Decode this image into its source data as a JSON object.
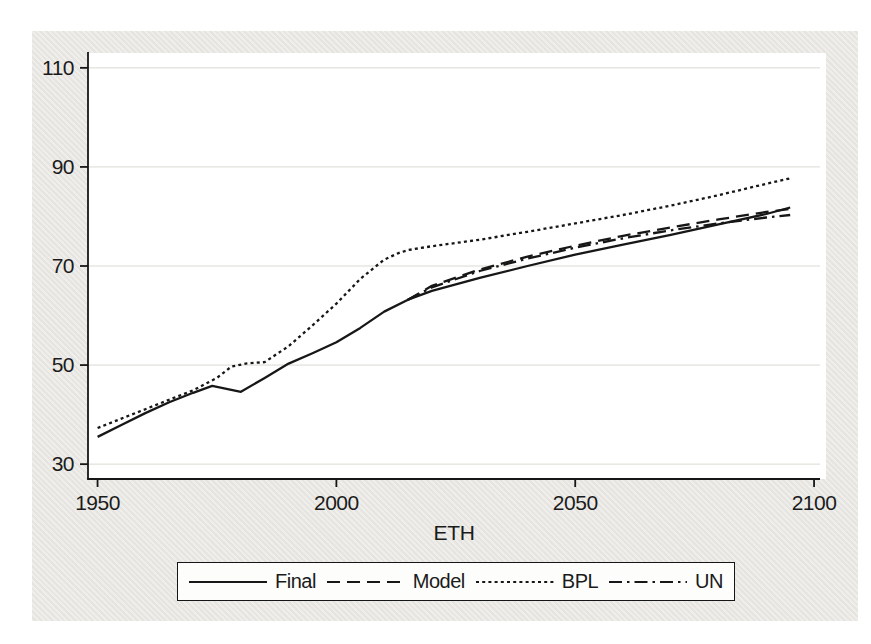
{
  "figure": {
    "xlabel": "ETH",
    "background_color": "#e9e8e4",
    "plot_background": "#ffffff",
    "line_color": "#171717",
    "grid_color": "#d9d9d2",
    "text_color": "#1b1b1b"
  },
  "chart_data": {
    "type": "line",
    "title": "",
    "xlabel": "ETH",
    "ylabel": "",
    "xlim": [
      1948,
      2102.5
    ],
    "ylim": [
      27,
      113
    ],
    "xticks": [
      1950,
      2000,
      2050,
      2100
    ],
    "yticks": [
      30,
      50,
      70,
      90,
      110
    ],
    "grid": "horizontal",
    "legend_position": "bottom",
    "series": [
      {
        "name": "Final",
        "dash": "solid",
        "points": [
          [
            1950,
            35.5
          ],
          [
            1955,
            37.9
          ],
          [
            1960,
            40.3
          ],
          [
            1965,
            42.5
          ],
          [
            1970,
            44.4
          ],
          [
            1974,
            45.8
          ],
          [
            1980,
            44.6
          ],
          [
            1985,
            47.4
          ],
          [
            1990,
            50.3
          ],
          [
            1995,
            52.4
          ],
          [
            2000,
            54.6
          ],
          [
            2005,
            57.5
          ],
          [
            2010,
            60.8
          ],
          [
            2015,
            63.2
          ],
          [
            2020,
            65.0
          ],
          [
            2030,
            67.6
          ],
          [
            2040,
            70.0
          ],
          [
            2050,
            72.3
          ],
          [
            2060,
            74.3
          ],
          [
            2070,
            76.3
          ],
          [
            2080,
            78.4
          ],
          [
            2090,
            80.5
          ],
          [
            2095,
            81.8
          ]
        ]
      },
      {
        "name": "Model",
        "dash": "dash",
        "points": [
          [
            2015,
            63.2
          ],
          [
            2020,
            66.0
          ],
          [
            2030,
            69.3
          ],
          [
            2040,
            71.9
          ],
          [
            2050,
            74.1
          ],
          [
            2060,
            76.1
          ],
          [
            2070,
            77.8
          ],
          [
            2080,
            79.4
          ],
          [
            2090,
            80.9
          ],
          [
            2095,
            81.5
          ]
        ]
      },
      {
        "name": "BPL",
        "dash": "dot",
        "points": [
          [
            1950,
            37.3
          ],
          [
            1955,
            39.2
          ],
          [
            1960,
            41.1
          ],
          [
            1965,
            43.0
          ],
          [
            1970,
            44.9
          ],
          [
            1975,
            47.4
          ],
          [
            1978,
            49.7
          ],
          [
            1981,
            50.3
          ],
          [
            1985,
            50.6
          ],
          [
            1990,
            53.8
          ],
          [
            1995,
            58.0
          ],
          [
            2000,
            62.4
          ],
          [
            2005,
            67.4
          ],
          [
            2010,
            71.3
          ],
          [
            2013,
            72.6
          ],
          [
            2015,
            73.2
          ],
          [
            2020,
            74.0
          ],
          [
            2030,
            75.3
          ],
          [
            2040,
            76.9
          ],
          [
            2050,
            78.6
          ],
          [
            2060,
            80.3
          ],
          [
            2070,
            82.2
          ],
          [
            2080,
            84.3
          ],
          [
            2090,
            86.6
          ],
          [
            2095,
            87.7
          ]
        ]
      },
      {
        "name": "UN",
        "dash": "dashdot",
        "points": [
          [
            2015,
            63.2
          ],
          [
            2020,
            65.7
          ],
          [
            2030,
            69.0
          ],
          [
            2040,
            71.5
          ],
          [
            2050,
            73.7
          ],
          [
            2060,
            75.6
          ],
          [
            2070,
            77.2
          ],
          [
            2080,
            78.6
          ],
          [
            2090,
            79.8
          ],
          [
            2095,
            80.3
          ]
        ]
      }
    ]
  }
}
